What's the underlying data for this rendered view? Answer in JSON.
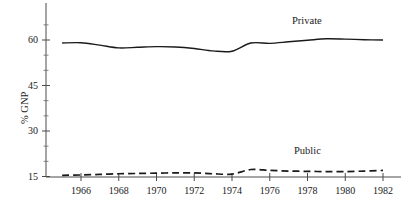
{
  "chart_data": {
    "type": "line",
    "title": "",
    "subtitle": "",
    "xlabel": "",
    "ylabel": "% GNP",
    "xlim": [
      1965,
      1982
    ],
    "ylim": [
      15,
      66
    ],
    "grid": false,
    "legend_position": "inline-annotation",
    "x_ticks": [
      1966,
      1968,
      1970,
      1972,
      1974,
      1976,
      1978,
      1980,
      1982
    ],
    "x_tick_labels": [
      "1966",
      "1968",
      "1970",
      "1972",
      "1974",
      "1976",
      "1978",
      "1980",
      "1982"
    ],
    "x_minor_ticks": [
      1965,
      1967,
      1969,
      1971,
      1973,
      1975,
      1977,
      1979,
      1981
    ],
    "y_ticks": [
      15,
      30,
      45,
      60
    ],
    "y_tick_labels": [
      "15",
      "30",
      "45",
      "60"
    ],
    "y_minor_ticks": [
      20,
      25,
      35,
      40,
      50,
      55,
      65
    ],
    "x": [
      1965,
      1966,
      1967,
      1968,
      1969,
      1970,
      1971,
      1972,
      1973,
      1974,
      1975,
      1976,
      1977,
      1978,
      1979,
      1980,
      1981,
      1982
    ],
    "series": [
      {
        "name": "Private",
        "style": "solid",
        "color": "#1a1a1a",
        "label_text": "Private",
        "values": [
          59.0,
          59.1,
          58.3,
          57.4,
          57.6,
          57.8,
          57.7,
          57.2,
          56.4,
          56.3,
          59.0,
          58.9,
          59.4,
          59.9,
          60.4,
          60.3,
          60.1,
          60.0
        ]
      },
      {
        "name": "Public",
        "style": "dashed",
        "color": "#1a1a1a",
        "label_text": "Public",
        "values": [
          15.4,
          15.5,
          15.7,
          15.9,
          16.0,
          16.1,
          16.2,
          16.2,
          15.9,
          15.8,
          17.3,
          17.0,
          16.8,
          16.7,
          16.6,
          16.6,
          16.8,
          17.0
        ]
      }
    ]
  },
  "annotations": {
    "private_label": "Private",
    "public_label": "Public"
  }
}
